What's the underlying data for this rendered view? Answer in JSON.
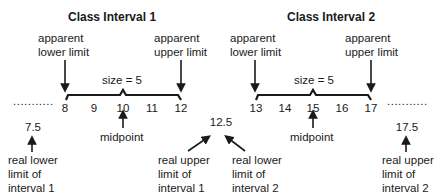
{
  "interval1": {
    "title": "Class Interval 1",
    "apparent_lower": [
      "apparent",
      "lower limit"
    ],
    "apparent_upper": [
      "apparent",
      "upper limit"
    ],
    "size_label": "size  =  5",
    "scores": [
      "8",
      "9",
      "10",
      "11",
      "12"
    ],
    "midpoint_label": "midpoint",
    "real_lower_value": "7.5",
    "real_lower_label": [
      "real lower",
      "limit of",
      "interval 1"
    ],
    "real_upper_label": [
      "real upper",
      "limit of",
      "interval 1"
    ]
  },
  "interval2": {
    "title": "Class Interval 2",
    "apparent_lower": [
      "apparent",
      "lower limit"
    ],
    "apparent_upper": [
      "apparent",
      "upper limit"
    ],
    "size_label": "size  =  5",
    "scores": [
      "13",
      "14",
      "15",
      "16",
      "17"
    ],
    "midpoint_label": "midpoint",
    "real_lower_label": [
      "real lower",
      "limit of",
      "interval 2"
    ],
    "real_upper_value": "17.5",
    "real_upper_label": [
      "real upper",
      "limit of",
      "interval 2"
    ]
  },
  "shared_boundary_value": "12.5",
  "ellipsis_left": "...........",
  "ellipsis_right": "..........."
}
